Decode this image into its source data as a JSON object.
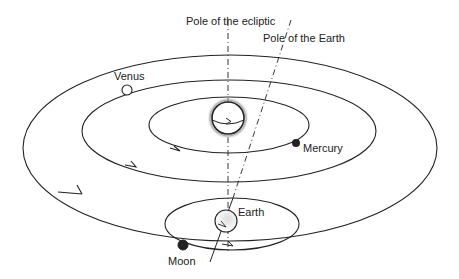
{
  "labels": {
    "pole_ecliptic": "Pole of the ecliptic",
    "pole_earth": "Pole of the Earth",
    "venus": "Venus",
    "mercury": "Mercury",
    "earth": "Earth",
    "moon": "Moon"
  },
  "colors": {
    "line": "#222222",
    "background": "#ffffff"
  },
  "bodies": [
    "Sun",
    "Mercury",
    "Venus",
    "Earth",
    "Moon"
  ],
  "axes": [
    "Pole of the ecliptic",
    "Pole of the Earth"
  ]
}
